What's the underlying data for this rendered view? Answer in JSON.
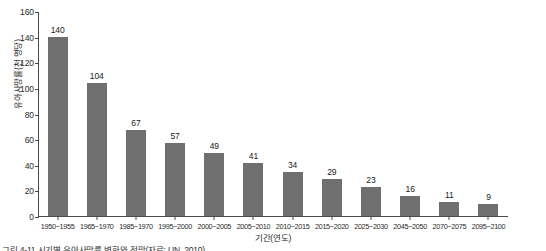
{
  "chart_data": {
    "type": "bar",
    "title": "",
    "xlabel": "기간(연도)",
    "ylabel": "유아사망률(천 명당)",
    "ylim": [
      0,
      160
    ],
    "ytick_values": [
      160,
      140,
      120,
      100,
      80,
      60,
      40,
      20,
      0
    ],
    "grid": false,
    "legend": "none",
    "bar_color": "#6f6f6f",
    "categories": [
      "1950~1955",
      "1965~1970",
      "1985~1970",
      "1995~2000",
      "2000~2005",
      "2005~2010",
      "2010~2015",
      "2015~2020",
      "2025~2030",
      "2045~2050",
      "2070~2075",
      "2095~2100"
    ],
    "values": [
      140,
      104,
      67,
      57,
      49,
      41,
      34,
      29,
      23,
      16,
      11,
      9
    ],
    "value_labels": [
      "140",
      "104",
      "67",
      "57",
      "49",
      "41",
      "34",
      "29",
      "23",
      "16",
      "11",
      "9"
    ]
  },
  "caption": {
    "text": "그림 4-11  시기별 유아사망률 변화와 전망(자료: UN, 2010)"
  }
}
